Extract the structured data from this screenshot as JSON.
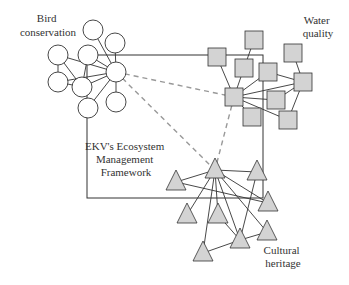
{
  "diagram": {
    "type": "network",
    "colors": {
      "stroke": "#333333",
      "node_fill_circle": "#ffffff",
      "node_fill_square": "#d3d3d3",
      "node_fill_triangle": "#d3d3d3",
      "dashed": "#999999"
    },
    "frame": {
      "label_lines": [
        "EKV's Ecosystem",
        "Management",
        "Framework"
      ],
      "x": 87,
      "y": 55,
      "width": 176,
      "height": 143
    },
    "clusters": [
      {
        "name": "bird-conservation",
        "label_lines": [
          "Bird",
          "conservation"
        ],
        "shape": "circle",
        "hub": 4,
        "nodes": [
          [
            93,
            30
          ],
          [
            115,
            43
          ],
          [
            58,
            55
          ],
          [
            88,
            55
          ],
          [
            116,
            72
          ],
          [
            58,
            82
          ],
          [
            82,
            87
          ],
          [
            88,
            108
          ],
          [
            116,
            102
          ]
        ],
        "edges": [
          [
            0,
            4
          ],
          [
            1,
            4
          ],
          [
            2,
            4
          ],
          [
            3,
            4
          ],
          [
            5,
            4
          ],
          [
            6,
            4
          ],
          [
            7,
            4
          ],
          [
            8,
            4
          ],
          [
            2,
            5
          ],
          [
            2,
            6
          ],
          [
            3,
            6
          ],
          [
            5,
            6
          ]
        ]
      },
      {
        "name": "water-quality",
        "label_lines": [
          "Water",
          "quality"
        ],
        "shape": "square",
        "hub": 6,
        "nodes": [
          [
            254,
            40
          ],
          [
            217,
            57
          ],
          [
            244,
            68
          ],
          [
            268,
            72
          ],
          [
            293,
            53
          ],
          [
            303,
            82
          ],
          [
            234,
            97
          ],
          [
            276,
            100
          ],
          [
            252,
            117
          ],
          [
            288,
            120
          ]
        ],
        "edges": [
          [
            1,
            6
          ],
          [
            2,
            6
          ],
          [
            3,
            6
          ],
          [
            5,
            6
          ],
          [
            7,
            6
          ],
          [
            9,
            6
          ],
          [
            0,
            2
          ],
          [
            4,
            5
          ],
          [
            3,
            5
          ],
          [
            5,
            7
          ],
          [
            5,
            9
          ],
          [
            8,
            6
          ]
        ]
      },
      {
        "name": "cultural-heritage",
        "label_lines": [
          "Cultural",
          "heritage"
        ],
        "shape": "triangle",
        "hub": 0,
        "nodes": [
          [
            215,
            170
          ],
          [
            176,
            182
          ],
          [
            257,
            172
          ],
          [
            268,
            203
          ],
          [
            187,
            215
          ],
          [
            218,
            215
          ],
          [
            267,
            232
          ],
          [
            240,
            240
          ],
          [
            203,
            253
          ]
        ],
        "edges": [
          [
            0,
            1
          ],
          [
            0,
            2
          ],
          [
            0,
            3
          ],
          [
            0,
            4
          ],
          [
            0,
            5
          ],
          [
            0,
            6
          ],
          [
            0,
            7
          ],
          [
            0,
            8
          ],
          [
            2,
            7
          ],
          [
            7,
            8
          ],
          [
            7,
            6
          ],
          [
            5,
            7
          ],
          [
            1,
            3
          ]
        ]
      }
    ],
    "dashed_links": [
      [
        "bird-conservation",
        "water-quality"
      ],
      [
        "bird-conservation",
        "cultural-heritage"
      ],
      [
        "water-quality",
        "cultural-heritage"
      ]
    ]
  }
}
